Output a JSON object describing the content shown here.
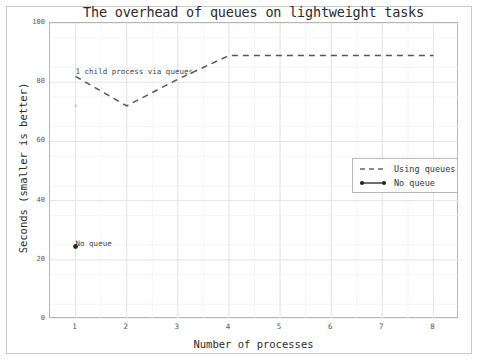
{
  "chart_data": {
    "type": "line",
    "title": "The overhead of queues on lightweight tasks",
    "xlabel": "Number of processes",
    "ylabel": "Seconds (smaller is better)",
    "xlim": [
      0.5,
      8.5
    ],
    "ylim": [
      0,
      100
    ],
    "xticks": [
      1,
      2,
      3,
      4,
      5,
      6,
      7,
      8
    ],
    "yticks": [
      0,
      20,
      40,
      60,
      80,
      100
    ],
    "grid": true,
    "legend_position": "center right",
    "x": [
      1,
      2,
      3,
      4,
      5,
      6,
      7,
      8
    ],
    "series": [
      {
        "name": "Using queues",
        "style": "dashed",
        "color": "#555555",
        "values": [
          82,
          72,
          81,
          89,
          89,
          89,
          89,
          89
        ]
      },
      {
        "name": "No queue",
        "style": "solid-with-markers",
        "color": "#222222",
        "values": [
          24.5,
          null,
          null,
          null,
          null,
          null,
          null,
          null
        ]
      }
    ],
    "annotations": [
      {
        "text": "1 child process via queues",
        "x": 1,
        "y": 83
      },
      {
        "text": "No queue",
        "x": 1,
        "y": 25
      }
    ]
  },
  "legend": {
    "items": [
      {
        "label": "Using queues"
      },
      {
        "label": "No queue"
      }
    ]
  }
}
